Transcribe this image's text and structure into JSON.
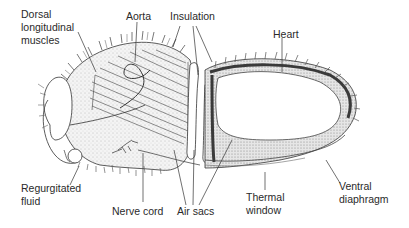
{
  "diagram": {
    "labels": {
      "dorsal_muscles": "Dorsal\nlongitudinal\nmuscles",
      "aorta": "Aorta",
      "insulation": "Insulation",
      "heart": "Heart",
      "regurgitated_fluid": "Regurgitated\nfluid",
      "nerve_cord": "Nerve cord",
      "air_sacs": "Air sacs",
      "thermal_window": "Thermal\nwindow",
      "ventral_diaphragm": "Ventral\ndiaphragm"
    },
    "colors": {
      "line": "#333333",
      "hair": "#555555",
      "stipple": "#d9d9d9",
      "heart_band": "#3a3a3a",
      "text": "#2a2a2a"
    }
  }
}
